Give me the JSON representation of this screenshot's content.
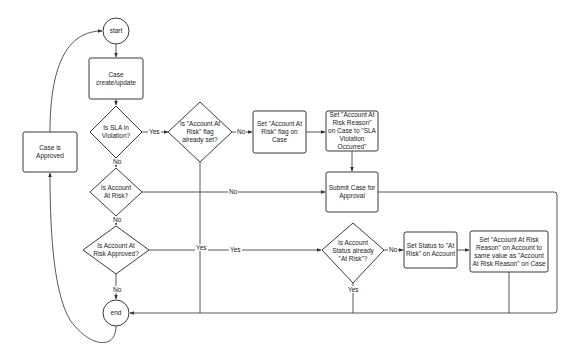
{
  "diagram": {
    "type": "flowchart",
    "nodes": {
      "start": "start",
      "case_create_update": "Case create/update",
      "is_sla_violation": "Is SLA in Violation?",
      "flag_already_set": "Is \"Account At Risk\" flag already set?",
      "set_flag_on_case": "Set \"Account At Risk\" flag on Case",
      "set_reason_on_case": "Set \"Account At Risk Reason\" on Case to \"SLA Violation Occurred\"",
      "submit_for_approval": "Submit Case for Approval",
      "case_is_approved": "Case is Approved",
      "is_account_at_risk": "Is Account At Risk?",
      "is_at_risk_approved": "Is Account At Risk Approved?",
      "account_status_at_risk": "Is Account Status already \"At Risk\"?",
      "set_status_at_risk": "Set Status to \"At Risk\" on Account",
      "set_reason_on_account": "Set \"Account At Risk Reason\" on Account to same value as \"Account At Risk Reason\" on Case",
      "end": "end"
    },
    "edge_labels": {
      "sla_yes": "Yes",
      "sla_no": "No",
      "flag_no": "No",
      "flag_yes": "Yes",
      "at_risk_no": "No",
      "at_risk_no_down": "No",
      "approved_yes": "Yes",
      "approved_no": "No",
      "status_no": "No",
      "status_yes": "Yes"
    }
  }
}
